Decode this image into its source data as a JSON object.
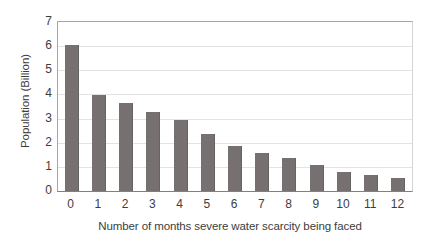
{
  "chart_data": {
    "type": "bar",
    "title": "",
    "xlabel": "Number of months severe water scarcity being faced",
    "ylabel": "Population (Billion)",
    "categories": [
      "0",
      "1",
      "2",
      "3",
      "4",
      "5",
      "6",
      "7",
      "8",
      "9",
      "10",
      "11",
      "12"
    ],
    "values": [
      6.05,
      3.98,
      3.65,
      3.28,
      2.95,
      2.35,
      1.85,
      1.57,
      1.37,
      1.08,
      0.78,
      0.66,
      0.55
    ],
    "ylim": [
      0,
      7
    ],
    "yticks": [
      "0",
      "1",
      "2",
      "3",
      "4",
      "5",
      "6",
      "7"
    ],
    "ytick_values": [
      0,
      1,
      2,
      3,
      4,
      5,
      6,
      7
    ],
    "grid": "horizontal",
    "legend": "none",
    "series": [
      {
        "name": "Population (Billion)",
        "color": "#767170",
        "values": [
          6.05,
          3.98,
          3.65,
          3.28,
          2.95,
          2.35,
          1.85,
          1.57,
          1.37,
          1.08,
          0.78,
          0.66,
          0.55
        ]
      }
    ],
    "colors": {
      "bar": "#767170",
      "gridline": "#e3e3e3",
      "axis": "#808080",
      "text": "#3d3d3d",
      "background": "#ffffff"
    }
  }
}
